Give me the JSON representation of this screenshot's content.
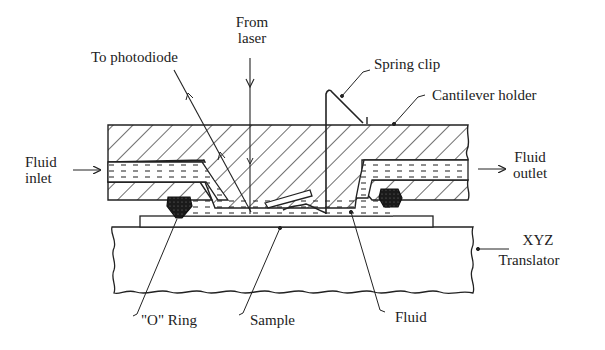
{
  "diagram": {
    "type": "cross-section schematic",
    "colors": {
      "ink": "#222222",
      "background": "#ffffff"
    },
    "labels": {
      "to_photodiode": "To photodiode",
      "from_laser_line1": "From",
      "from_laser_line2": "laser",
      "spring_clip": "Spring clip",
      "cantilever_holder": "Cantilever holder",
      "fluid_inlet_line1": "Fluid",
      "fluid_inlet_line2": "inlet",
      "fluid_outlet_line1": "Fluid",
      "fluid_outlet_line2": "outlet",
      "xyz_line1": "XYZ",
      "xyz_line2": "Translator",
      "o_ring": "\"O\" Ring",
      "sample": "Sample",
      "fluid": "Fluid"
    },
    "components": [
      {
        "name": "cantilever-holder",
        "fill": "hatched"
      },
      {
        "name": "fluid-inlet-channel",
        "fill": "dashed-fluid"
      },
      {
        "name": "fluid-outlet-channel",
        "fill": "dashed-fluid"
      },
      {
        "name": "o-ring-left",
        "fill": "solid-dark"
      },
      {
        "name": "o-ring-right",
        "fill": "solid-dark"
      },
      {
        "name": "cantilever",
        "fill": "none"
      },
      {
        "name": "spring-clip",
        "fill": "none"
      },
      {
        "name": "sample",
        "fill": "none"
      },
      {
        "name": "xyz-translator",
        "fill": "none"
      },
      {
        "name": "laser-beam",
        "direction": "down"
      },
      {
        "name": "reflected-beam",
        "direction": "up-left"
      }
    ]
  }
}
